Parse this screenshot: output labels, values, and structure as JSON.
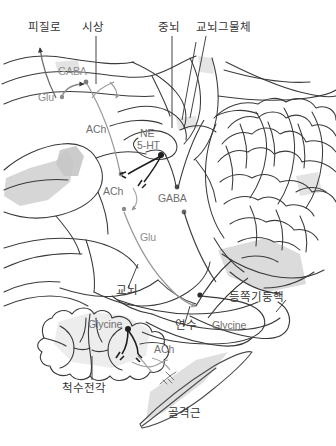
{
  "figure": {
    "type": "anatomical-diagram",
    "background_color": "#ffffff",
    "ink_color": "#3a3a3a",
    "pathway_gray": "#9a9a9a",
    "pathway_black": "#1f1f1f",
    "shade_light": "#ececec",
    "shade_mid": "#d9d9d9",
    "shade_dark": "#c9c9c9"
  },
  "region_labels": {
    "cortical_tract": "피질로",
    "thalamus": "시상",
    "midbrain": "중뇌",
    "pontine_reticular_formation": "교뇌그물체",
    "pons": "교뇌",
    "medulla": "연수",
    "dorsal_column_nuclei": "등쪽기둥핵",
    "anterior_horn_of_spinal_cord": "척수전각",
    "skeletal_muscle": "골격근"
  },
  "neurotransmitters": {
    "gaba_cortex": "GABA",
    "glu_cortex": "Glu",
    "ach_upper": "ACh",
    "ne": "NE",
    "serotonin": "5-HT",
    "ach_mid": "ACh",
    "gaba_mid": "GABA",
    "glu_lower": "Glu",
    "glycine_cord": "Glycine",
    "glycine_right": "Glycine",
    "ach_muscle": "ACh"
  }
}
